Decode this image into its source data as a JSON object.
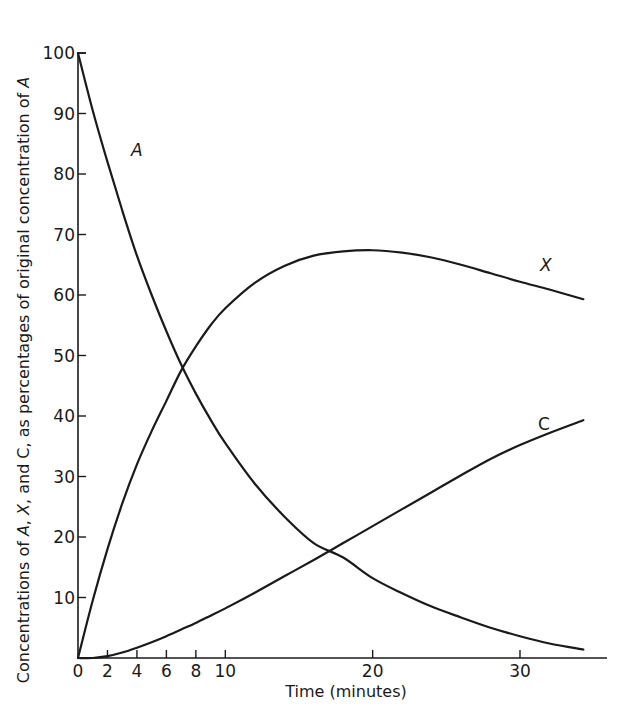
{
  "chart_data": {
    "type": "line",
    "title": "",
    "xlabel": "Time (minutes)",
    "ylabel": "Concentrations of A, X, and C, as percentages of original concentration of A",
    "xlim": [
      0,
      35
    ],
    "ylim": [
      0,
      100
    ],
    "x_ticks": [
      0,
      2,
      4,
      6,
      8,
      10,
      20,
      30
    ],
    "y_ticks": [
      10,
      20,
      30,
      40,
      50,
      60,
      70,
      80,
      90,
      100
    ],
    "grid": false,
    "legend": "inline labels on curves",
    "x": [
      0,
      1,
      2,
      3,
      4,
      5,
      6,
      7,
      8,
      9,
      10,
      12,
      14,
      16,
      18,
      20,
      22,
      24,
      26,
      28,
      30,
      32,
      34.3
    ],
    "series": [
      {
        "name": "A",
        "values": [
          100,
          90.5,
          82,
          74,
          66.5,
          60,
          54,
          48.5,
          43.7,
          39.4,
          35.5,
          28.8,
          23.4,
          19.0,
          16.6,
          13.2,
          10.7,
          8.5,
          6.7,
          5.0,
          3.6,
          2.4,
          1.4
        ]
      },
      {
        "name": "X",
        "values": [
          0,
          9.5,
          18,
          25.5,
          32,
          37.5,
          42.5,
          47.5,
          51.5,
          55,
          57.8,
          62,
          64.8,
          66.5,
          67.2,
          67.4,
          67,
          66.2,
          65,
          63.6,
          62.2,
          60.9,
          59.3
        ]
      },
      {
        "name": "C",
        "values": [
          0,
          0,
          0.3,
          0.9,
          1.7,
          2.6,
          3.6,
          4.7,
          5.8,
          7.0,
          8.2,
          10.8,
          13.5,
          16.2,
          19.0,
          21.8,
          24.6,
          27.4,
          30.2,
          32.9,
          35.2,
          37.2,
          39.3
        ]
      }
    ],
    "annotations": [
      {
        "text": "A",
        "near": [
          4.5,
          86
        ]
      },
      {
        "text": "X",
        "near": [
          32,
          64
        ]
      },
      {
        "text": "C",
        "near": [
          32.5,
          41
        ]
      }
    ]
  },
  "labels": {
    "x_axis_title": "Time (minutes)",
    "y_axis_title_part1": "Concentrations of ",
    "y_axis_A1": "A",
    "y_axis_comma1": ", ",
    "y_axis_X": "X",
    "y_axis_mid": ", and C, as percentages of original concentration of ",
    "y_axis_A2": "A",
    "series_A": "A",
    "series_X": "X",
    "series_C": "C"
  }
}
